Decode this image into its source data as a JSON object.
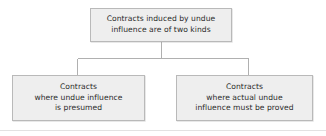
{
  "diagram": {
    "type": "flowchart",
    "orientation": "top-down",
    "background_color": "#ffffff",
    "node_fill_color": "#eeeeee",
    "node_border_color": "#b9b9b9",
    "connector_color": "#b0b0b0",
    "text_color": "#2b2b2b",
    "nodes": {
      "root": {
        "text": "Contracts induced by undue\ninfluence are of two kinds",
        "lines": [
          "Contracts induced by undue",
          "influence are of two kinds"
        ]
      },
      "presumed": {
        "text": "Contracts\nwhere undue influence\nis presumed",
        "lines": [
          "Contracts",
          "where undue influence",
          "is presumed"
        ]
      },
      "proved": {
        "text": "Contracts\nwhere actual undue\ninfluence must be proved",
        "lines": [
          "Contracts",
          "where actual undue",
          "influence must be proved"
        ]
      }
    },
    "edges": [
      {
        "from": "root",
        "to": "presumed"
      },
      {
        "from": "root",
        "to": "proved"
      }
    ]
  }
}
